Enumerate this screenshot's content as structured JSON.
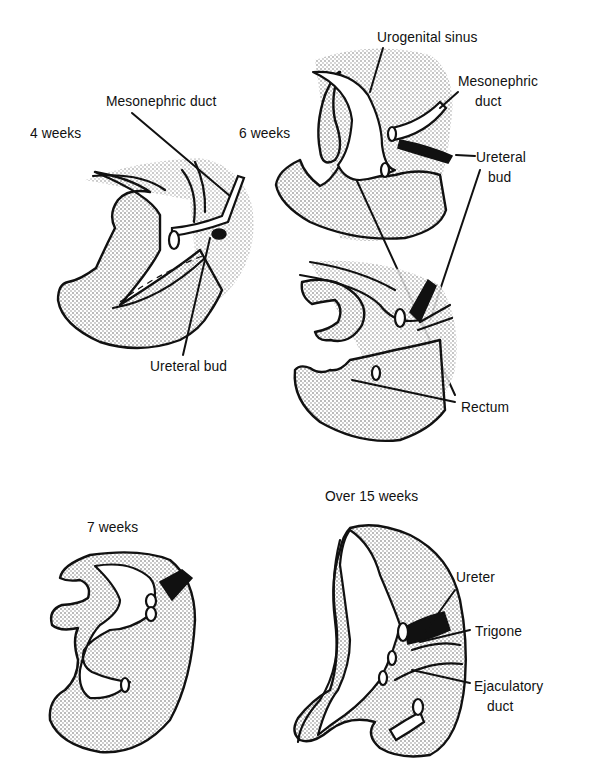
{
  "figure": {
    "colors": {
      "ink": "#111111",
      "background": "#ffffff",
      "stipple": "#9a9a9a"
    },
    "panels": [
      {
        "id": "4-weeks",
        "stage_label": "4 weeks",
        "annotations": [
          "Mesonephric duct",
          "Ureteral bud"
        ]
      },
      {
        "id": "6-weeks",
        "stage_label": "6 weeks",
        "annotations": [
          "Urogenital sinus",
          "Mesonephric duct",
          "Ureteral bud",
          "Rectum"
        ]
      },
      {
        "id": "7-weeks",
        "stage_label": "7 weeks",
        "annotations": []
      },
      {
        "id": "over-15-weeks",
        "stage_label": "Over 15 weeks",
        "annotations": [
          "Ureter",
          "Trigone",
          "Ejaculatory duct"
        ]
      }
    ]
  },
  "labels": {
    "week4": "4 weeks",
    "week6": "6 weeks",
    "week7": "7 weeks",
    "week15": "Over 15 weeks",
    "mesonephric_duct_4w": "Mesonephric duct",
    "ureteral_bud_4w": "Ureteral bud",
    "urogenital_sinus": "Urogenital sinus",
    "mesonephric_6w_line1": "Mesonephric",
    "mesonephric_6w_line2": "duct",
    "ureteral_6w_line1": "Ureteral",
    "ureteral_6w_line2": "bud",
    "rectum": "Rectum",
    "ureter": "Ureter",
    "trigone": "Trigone",
    "ejaculatory_line1": "Ejaculatory",
    "ejaculatory_line2": "duct"
  }
}
